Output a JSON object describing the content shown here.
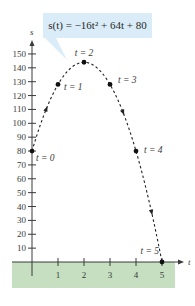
{
  "chart_data": {
    "type": "scatter",
    "title": "",
    "equation": "s(t) = −16t² + 64t + 80",
    "xlabel": "t",
    "ylabel": "s",
    "xlim": [
      0,
      5
    ],
    "ylim": [
      0,
      150
    ],
    "x_ticks": [
      1,
      2,
      3,
      4,
      5
    ],
    "y_ticks": [
      10,
      20,
      30,
      40,
      50,
      60,
      70,
      80,
      90,
      100,
      110,
      120,
      130,
      140,
      150
    ],
    "grid": false,
    "series": [
      {
        "name": "s(t)",
        "style": "dashed curve with direction arrows",
        "points": [
          {
            "t": 0,
            "s": 80,
            "label": "t = 0"
          },
          {
            "t": 1,
            "s": 128,
            "label": "t = 1"
          },
          {
            "t": 2,
            "s": 144,
            "label": "t = 2"
          },
          {
            "t": 3,
            "s": 128,
            "label": "t = 3"
          },
          {
            "t": 4,
            "s": 80,
            "label": "t = 4"
          },
          {
            "t": 5,
            "s": 0,
            "label": "t = 5"
          }
        ]
      }
    ],
    "ground_band_color": "#c5dfc0",
    "callout_color": "#d9ecf7"
  },
  "callout": {
    "text": "s(t) = −16t² + 64t + 80"
  }
}
